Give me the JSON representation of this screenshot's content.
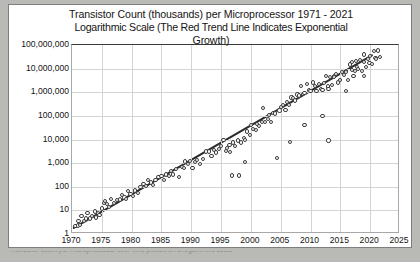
{
  "figure": {
    "title_lines": [
      "Transistor Count (thousands) per Microprocessor 1971 - 2021",
      "Logarithmic Scale (The Red Trend Line Indicates Exponential",
      "Growth)"
    ],
    "caption": "Transistor count per microprocessor over time plotted on a logarithmic scale"
  },
  "colors": {
    "trend_line": "#2b2b2b",
    "point_stroke": "#3c3c3c",
    "gridline": "#d4d4d4",
    "plot_border": "#a8a8a8",
    "page_background": "#b9b9b5",
    "figure_background": "#ffffff",
    "text": "#141414"
  },
  "chart_data": {
    "type": "scatter",
    "title": "Transistor Count (thousands) per Microprocessor 1971 - 2021 Logarithmic Scale (The Red Trend Line Indicates Exponential Growth)",
    "xlabel": "",
    "ylabel": "",
    "grid": true,
    "legend": "none",
    "yscale": "log",
    "xlim": [
      1970,
      2025
    ],
    "ylim": [
      1,
      100000000
    ],
    "xticks": [
      1970,
      1975,
      1980,
      1985,
      1990,
      1995,
      2000,
      2005,
      2010,
      2015,
      2020,
      2025
    ],
    "xtick_labels": [
      "1970",
      "1975",
      "1980",
      "1985",
      "1990",
      "1995",
      "2000",
      "2005",
      "2010",
      "2015",
      "2020",
      "2025"
    ],
    "yticks": [
      1,
      10,
      100,
      1000,
      10000,
      100000,
      1000000,
      10000000,
      100000000
    ],
    "ytick_labels": [
      "1",
      "10",
      "100",
      "1,000",
      "10,000",
      "100,000",
      "1,000,000",
      "10,000,000",
      "100,000,000"
    ],
    "series": [
      {
        "name": "Microprocessor transistor count",
        "marker": "open-circle",
        "points": [
          [
            1970.6,
            2.2
          ],
          [
            1971.0,
            2.3
          ],
          [
            1971.1,
            3.5
          ],
          [
            1971.4,
            2.5
          ],
          [
            1971.6,
            6.0
          ],
          [
            1972.0,
            3.5
          ],
          [
            1972.3,
            4.5
          ],
          [
            1972.6,
            8.0
          ],
          [
            1973.0,
            4.5
          ],
          [
            1973.4,
            6.0
          ],
          [
            1973.8,
            9.0
          ],
          [
            1974.0,
            5.0
          ],
          [
            1974.3,
            8.0
          ],
          [
            1974.6,
            6.5
          ],
          [
            1975.0,
            12.0
          ],
          [
            1975.3,
            20.0
          ],
          [
            1975.6,
            25.0
          ],
          [
            1975.9,
            18.0
          ],
          [
            1976.2,
            14.0
          ],
          [
            1976.5,
            30.0
          ],
          [
            1977.0,
            20.0
          ],
          [
            1977.5,
            28.0
          ],
          [
            1978.0,
            29.0
          ],
          [
            1978.4,
            45.0
          ],
          [
            1978.8,
            35.0
          ],
          [
            1979.0,
            30.0
          ],
          [
            1979.4,
            68.0
          ],
          [
            1979.8,
            50.0
          ],
          [
            1980.2,
            40.0
          ],
          [
            1980.6,
            70.0
          ],
          [
            1981.0,
            55.0
          ],
          [
            1981.5,
            100.0
          ],
          [
            1982.0,
            134.0
          ],
          [
            1982.4,
            110.0
          ],
          [
            1982.8,
            190.0
          ],
          [
            1983.2,
            150.0
          ],
          [
            1983.6,
            120.0
          ],
          [
            1984.0,
            190.0
          ],
          [
            1984.5,
            260.0
          ],
          [
            1985.0,
            275.0
          ],
          [
            1985.4,
            200.0
          ],
          [
            1985.8,
            330.0
          ],
          [
            1986.2,
            290.0
          ],
          [
            1986.6,
            450.0
          ],
          [
            1987.0,
            330.0
          ],
          [
            1987.5,
            550.0
          ],
          [
            1988.0,
            250.0
          ],
          [
            1988.4,
            700.0
          ],
          [
            1988.8,
            600.0
          ],
          [
            1989.0,
            1180.0
          ],
          [
            1989.4,
            900.0
          ],
          [
            1989.8,
            1200.0
          ],
          [
            1990.2,
            600.0
          ],
          [
            1990.6,
            1100.0
          ],
          [
            1991.0,
            1350.0
          ],
          [
            1991.5,
            900.0
          ],
          [
            1992.0,
            1500.0
          ],
          [
            1992.5,
            3100.0
          ],
          [
            1993.0,
            3100.0
          ],
          [
            1993.4,
            2000.0
          ],
          [
            1993.8,
            3500.0
          ],
          [
            1994.2,
            2800.0
          ],
          [
            1994.6,
            4000.0
          ],
          [
            1995.0,
            5500.0
          ],
          [
            1995.4,
            9300.0
          ],
          [
            1995.8,
            3300.0
          ],
          [
            1996.0,
            4300.0
          ],
          [
            1996.4,
            6000.0
          ],
          [
            1996.8,
            300.0
          ],
          [
            1997.0,
            7500.0
          ],
          [
            1997.4,
            5500.0
          ],
          [
            1997.8,
            9000.0
          ],
          [
            1998.0,
            300.0
          ],
          [
            1998.4,
            7500.0
          ],
          [
            1998.8,
            12000.0
          ],
          [
            1999.0,
            9500.0
          ],
          [
            1999.4,
            22000.0
          ],
          [
            1999.8,
            15000.0
          ],
          [
            2000.0,
            42000.0
          ],
          [
            2000.4,
            28000.0
          ],
          [
            2000.8,
            25000.0
          ],
          [
            2001.0,
            45000.0
          ],
          [
            2001.4,
            37000.0
          ],
          [
            2001.8,
            55000.0
          ],
          [
            2002.0,
            220000.0
          ],
          [
            2002.4,
            55000.0
          ],
          [
            2002.8,
            75000.0
          ],
          [
            2003.0,
            105000.0
          ],
          [
            2003.4,
            54000.0
          ],
          [
            2003.8,
            130000.0
          ],
          [
            2004.0,
            125000.0
          ],
          [
            2004.4,
            1700.0
          ],
          [
            2004.8,
            170000.0
          ],
          [
            2005.0,
            230000.0
          ],
          [
            2005.4,
            290000.0
          ],
          [
            2005.8,
            180000.0
          ],
          [
            2006.0,
            380000.0
          ],
          [
            2006.4,
            291000.0
          ],
          [
            2006.8,
            600000.0
          ],
          [
            2007.0,
            580000.0
          ],
          [
            2007.4,
            450000.0
          ],
          [
            2007.8,
            800000.0
          ],
          [
            2008.0,
            730000.0
          ],
          [
            2008.4,
            1900000.0
          ],
          [
            2008.8,
            820000.0
          ],
          [
            2009.0,
            900000.0
          ],
          [
            2009.4,
            2300000.0
          ],
          [
            2009.8,
            1200000.0
          ],
          [
            2010.0,
            1170000.0
          ],
          [
            2010.4,
            2600000.0
          ],
          [
            2010.8,
            1900000.0
          ],
          [
            2011.0,
            1160000.0
          ],
          [
            2011.4,
            2270000.0
          ],
          [
            2011.8,
            1400000.0
          ],
          [
            2012.0,
            1200000.0
          ],
          [
            2012.3,
            2400000.0
          ],
          [
            2012.6,
            5000000.0
          ],
          [
            2012.9,
            1750000.0
          ],
          [
            2013.0,
            1400000.0
          ],
          [
            2013.3,
            4300000.0
          ],
          [
            2013.6,
            2000000.0
          ],
          [
            2013.9,
            5000000.0
          ],
          [
            2014.0,
            4300000.0
          ],
          [
            2014.3,
            5700000.0
          ],
          [
            2014.6,
            2600000.0
          ],
          [
            2014.9,
            3200000.0
          ],
          [
            2015.0,
            3300000.0
          ],
          [
            2015.3,
            7200000.0
          ],
          [
            2015.6,
            5500000.0
          ],
          [
            2015.9,
            8000000.0
          ],
          [
            2016.0,
            7200000.0
          ],
          [
            2016.3,
            3200000.0
          ],
          [
            2016.6,
            15000000.0
          ],
          [
            2016.9,
            9000000.0
          ],
          [
            2017.0,
            19200000.0
          ],
          [
            2017.2,
            4800000.0
          ],
          [
            2017.4,
            8000000.0
          ],
          [
            2017.6,
            21000000.0
          ],
          [
            2017.8,
            12000000.0
          ],
          [
            2018.0,
            10000000.0
          ],
          [
            2018.3,
            23000000.0
          ],
          [
            2018.6,
            8000000.0
          ],
          [
            2018.9,
            19000000.0
          ],
          [
            2019.0,
            39500000.0
          ],
          [
            2019.3,
            12000000.0
          ],
          [
            2019.6,
            26000000.0
          ],
          [
            2019.9,
            18000000.0
          ],
          [
            2020.0,
            35000000.0
          ],
          [
            2020.3,
            16000000.0
          ],
          [
            2020.6,
            54000000.0
          ],
          [
            2020.9,
            28000000.0
          ],
          [
            2021.0,
            26000000.0
          ],
          [
            2021.3,
            58000000.0
          ],
          [
            2021.6,
            30000000.0
          ],
          [
            2012.0,
            100000.0
          ],
          [
            2013.0,
            9000.0
          ],
          [
            2009.0,
            42000.0
          ],
          [
            2006.5,
            8000.0
          ],
          [
            1996.5,
            3000.0
          ],
          [
            1999.0,
            1100.0
          ],
          [
            2016.0,
            1100000.0
          ],
          [
            2019.0,
            5000000.0
          ]
        ]
      }
    ],
    "trend_line": {
      "name": "Red Trend Line (exponential growth)",
      "color": "#2b2b2b",
      "x_start": 1970.3,
      "y_start": 1.5,
      "x_end": 2020.6,
      "y_end": 36000000.0
    }
  }
}
